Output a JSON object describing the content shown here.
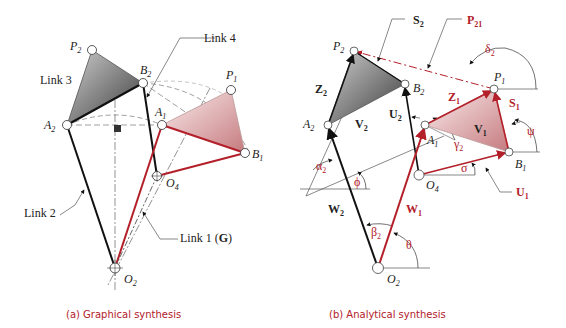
{
  "colors": {
    "red": "#b3202a",
    "black": "#111111",
    "gray_fill_dark": "#555555",
    "red_fill_light": "#f2d8d8"
  },
  "left": {
    "caption": "(a)  Graphical synthesis",
    "labels": {
      "link3": "Link 3",
      "link4": "Link 4",
      "link2": "Link 2",
      "link1": "Link 1 (",
      "link1_g": "G",
      "link1_close": ")",
      "P2": "P",
      "P2_sub": "2",
      "B2": "B",
      "B2_sub": "2",
      "A2": "A",
      "A2_sub": "2",
      "A1": "A",
      "A1_sub": "1",
      "P1": "P",
      "P1_sub": "1",
      "B1": "B",
      "B1_sub": "1",
      "O4": "O",
      "O4_sub": "4",
      "O2": "O",
      "O2_sub": "2"
    }
  },
  "right": {
    "caption": "(b)  Analytical synthesis",
    "labels": {
      "S2": "S",
      "S2_sub": "2",
      "P21": "P",
      "P21_sub": "21",
      "delta2": "δ",
      "delta2_sub": "2",
      "P2": "P",
      "P2_sub": "2",
      "B2": "B",
      "B2_sub": "2",
      "P1": "P",
      "P1_sub": "1",
      "Z2": "Z",
      "Z2_sub": "2",
      "Z1": "Z",
      "Z1_sub": "1",
      "S1": "S",
      "S1_sub": "1",
      "U2": "U",
      "U2_sub": "2",
      "A2": "A",
      "A2_sub": "2",
      "V2": "V",
      "V2_sub": "2",
      "V1": "V",
      "V1_sub": "1",
      "psi": "ψ",
      "A1": "A",
      "A1_sub": "1",
      "gamma2": "γ",
      "gamma2_sub": "2",
      "B1": "B",
      "B1_sub": "1",
      "alpha2": "α",
      "alpha2_sub": "2",
      "phi": "ϕ",
      "O4": "O",
      "O4_sub": "4",
      "sigma": "σ",
      "U1": "U",
      "U1_sub": "1",
      "W2": "W",
      "W2_sub": "2",
      "W1": "W",
      "W1_sub": "1",
      "beta2": "β",
      "beta2_sub": "2",
      "theta": "θ",
      "O2": "O",
      "O2_sub": "2"
    }
  }
}
